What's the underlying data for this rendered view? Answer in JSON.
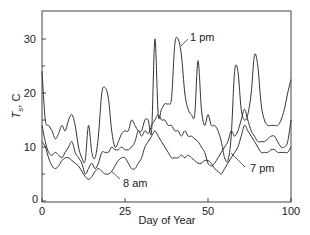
{
  "chart_data": {
    "type": "line",
    "title": "",
    "xlabel": "Day of Year",
    "ylabel": "T_s, C",
    "ylabel_main": "T",
    "ylabel_sub": "s",
    "ylabel_unit": ", C",
    "xlim": [
      0,
      100
    ],
    "ylim": [
      0,
      35
    ],
    "x_ticks": [
      {
        "label": "0",
        "pos": 0
      },
      {
        "label": "25",
        "pos": 25
      },
      {
        "label": "50",
        "pos": 50
      },
      {
        "label": "100",
        "pos": 75
      }
    ],
    "y_ticks": [
      0,
      10,
      20,
      30
    ],
    "y_minor_ticks": [
      5,
      15,
      25
    ],
    "grid": false,
    "annotations": [
      {
        "text": "1 pm",
        "series": "1 pm"
      },
      {
        "text": "8 am",
        "series": "8 am"
      },
      {
        "text": "7 pm",
        "series": "7 pm"
      }
    ],
    "series": [
      {
        "name": "1 pm",
        "x": [
          0,
          1,
          2,
          3,
          4,
          5,
          6,
          7,
          8,
          9,
          10,
          11,
          12,
          13,
          14,
          15,
          16,
          17,
          18,
          19,
          20,
          21,
          22,
          23,
          24,
          25,
          26,
          27,
          28,
          29,
          30,
          31,
          32,
          33,
          34,
          35,
          36,
          37,
          38,
          39,
          40,
          41,
          42,
          43,
          44,
          45,
          46,
          47,
          48,
          49,
          50,
          51,
          52,
          53,
          54,
          55,
          56,
          57,
          58,
          59,
          60,
          61,
          62,
          63,
          64,
          65,
          66,
          67,
          68,
          69,
          70,
          71,
          72,
          73,
          74,
          75
        ],
        "values": [
          24,
          15,
          14,
          13,
          11.5,
          12.5,
          14,
          13,
          15,
          16,
          14,
          10,
          8,
          7.5,
          14,
          9,
          8,
          12,
          20,
          21,
          19,
          13,
          10,
          11,
          12.5,
          13,
          13,
          15,
          14,
          13,
          13,
          15,
          15,
          13,
          30,
          16,
          17,
          18,
          18,
          19,
          29,
          30,
          27,
          20,
          17,
          16,
          16,
          26,
          17,
          14,
          16,
          14,
          14,
          13,
          11,
          8,
          7.5,
          12,
          24,
          24,
          17,
          15,
          16,
          20,
          27,
          25,
          18,
          15,
          14,
          14,
          14,
          14,
          15,
          17,
          20,
          22.5
        ]
      },
      {
        "name": "7 pm",
        "x": [
          0,
          1,
          2,
          3,
          4,
          5,
          6,
          7,
          8,
          9,
          10,
          11,
          12,
          13,
          14,
          15,
          16,
          17,
          18,
          19,
          20,
          21,
          22,
          23,
          24,
          25,
          26,
          27,
          28,
          29,
          30,
          31,
          32,
          33,
          34,
          35,
          36,
          37,
          38,
          39,
          40,
          41,
          42,
          43,
          44,
          45,
          46,
          47,
          48,
          49,
          50,
          51,
          52,
          53,
          54,
          55,
          56,
          57,
          58,
          59,
          60,
          61,
          62,
          63,
          64,
          65,
          66,
          67,
          68,
          69,
          70,
          71,
          72,
          73,
          74,
          75
        ],
        "values": [
          14,
          11,
          9,
          8.5,
          9,
          8.5,
          8,
          9,
          10,
          11,
          9,
          8,
          7,
          5,
          6,
          7,
          6,
          7,
          9,
          9,
          9,
          10,
          9.5,
          9.5,
          10,
          9.5,
          9.5,
          10,
          11,
          13,
          12,
          13,
          12.5,
          14,
          15,
          16,
          15,
          15,
          14,
          14,
          13,
          13,
          12,
          13,
          12,
          12,
          11.5,
          11,
          10,
          9,
          7,
          6.5,
          7,
          8,
          9,
          10,
          11,
          13,
          12,
          13,
          15,
          17,
          15,
          13,
          12,
          11,
          11,
          11,
          11.5,
          12,
          12,
          11,
          10,
          10,
          11,
          15
        ]
      },
      {
        "name": "8 am",
        "x": [
          0,
          1,
          2,
          3,
          4,
          5,
          6,
          7,
          8,
          9,
          10,
          11,
          12,
          13,
          14,
          15,
          16,
          17,
          18,
          19,
          20,
          21,
          22,
          23,
          24,
          25,
          26,
          27,
          28,
          29,
          30,
          31,
          32,
          33,
          34,
          35,
          36,
          37,
          38,
          39,
          40,
          41,
          42,
          43,
          44,
          45,
          46,
          47,
          48,
          49,
          50,
          51,
          52,
          53,
          54,
          55,
          56,
          57,
          58,
          59,
          60,
          61,
          62,
          63,
          64,
          65,
          66,
          67,
          68,
          69,
          70,
          71,
          72,
          73,
          74,
          75
        ],
        "values": [
          11,
          10,
          8,
          6.5,
          6,
          6.5,
          7.5,
          8,
          8,
          7.5,
          7,
          6.5,
          5.5,
          4.5,
          4,
          4.5,
          5.5,
          6,
          5.5,
          5,
          5,
          5.5,
          6.5,
          7.5,
          8,
          8,
          7,
          6,
          6,
          7,
          8,
          10,
          11,
          12,
          13,
          12,
          11,
          10,
          9,
          8,
          8,
          8,
          8.5,
          8,
          8.5,
          8,
          7.5,
          7,
          7,
          7.5,
          7.5,
          7,
          6,
          5.5,
          5,
          6,
          7,
          8,
          9,
          10,
          12,
          14,
          13,
          12,
          11,
          10,
          9,
          9,
          9,
          9.5,
          9.5,
          9,
          9,
          9,
          9,
          10
        ]
      }
    ]
  }
}
